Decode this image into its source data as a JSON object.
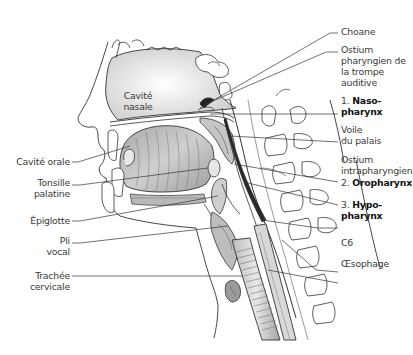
{
  "figure": {
    "labels_right": [
      {
        "id": "choane",
        "text": "Choane"
      },
      {
        "id": "ostium-pharyngien",
        "lines": [
          "Ostium",
          "pharyngien de",
          "la trompe",
          "auditive"
        ]
      },
      {
        "id": "nasopharynx",
        "number": "1.",
        "lines": [
          "Naso-",
          "pharynx"
        ]
      },
      {
        "id": "voile-palais",
        "lines": [
          "Voile",
          "du palais"
        ]
      },
      {
        "id": "ostium-intrapharyngien",
        "lines": [
          "Ostium",
          "intrapharyngien"
        ]
      },
      {
        "id": "oropharynx",
        "number": "2.",
        "text": "Oropharynx"
      },
      {
        "id": "hypopharynx",
        "number": "3.",
        "lines": [
          "Hypo-",
          "pharynx"
        ]
      },
      {
        "id": "c6",
        "text": "C6"
      },
      {
        "id": "oesophage",
        "text": "Œsophage"
      }
    ],
    "labels_left": [
      {
        "id": "cavite-orale",
        "text": "Cavité orale"
      },
      {
        "id": "tonsille-palatine",
        "lines": [
          "Tonsille",
          "palatine"
        ]
      },
      {
        "id": "epiglotte",
        "text": "Épiglotte"
      },
      {
        "id": "pli-vocal",
        "lines": [
          "Pli",
          "vocal"
        ]
      },
      {
        "id": "trachee-cervicale",
        "lines": [
          "Trachée",
          "cervicale"
        ]
      }
    ],
    "labels_inner": [
      {
        "id": "cavite-nasale",
        "lines": [
          "Cavité",
          "nasale"
        ]
      }
    ],
    "colors": {
      "line": "#333333",
      "tissue_fill": "#d9d9d9",
      "tissue_dark": "#9a9a9a",
      "airway_dark": "#2a2a2a",
      "background": "#ffffff"
    }
  }
}
